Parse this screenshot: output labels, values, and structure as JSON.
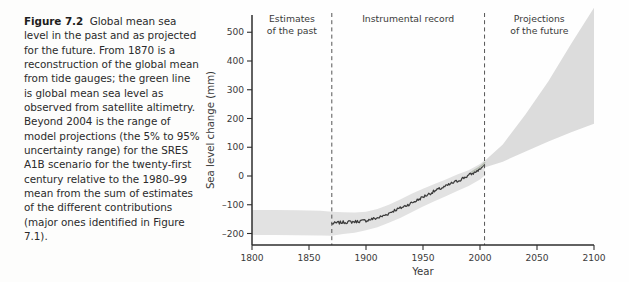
{
  "caption": {
    "figure_label": "Figure 7.2",
    "text": "Global mean sea level in the past and as projected for the future. From 1870 is a reconstruction of the global mean from tide gauges; the green line is global mean sea level as observed from satellite altimetry. Beyond 2004 is the range of model projections (the 5% to 95% uncertainty range) for the SRES A1B scenario for the twenty-first century relative to the 1980–99 mean from the sum of estimates of the different contributions (major ones identified in Figure 7.1)."
  },
  "colors": {
    "axis": "#2e2e2e",
    "band": "#e2e2e2",
    "reconstruction_line": "#3b3b3b",
    "satellite_line": "#b9bfb4",
    "projection_cone": "#dcdcdc",
    "divider": "#555555",
    "text": "#3a3a3a"
  },
  "chart_data": {
    "type": "line",
    "title": "",
    "xlabel": "Year",
    "ylabel": "Sea level change (mm)",
    "xlim": [
      1800,
      2100
    ],
    "ylim": [
      -240,
      560
    ],
    "xticks": [
      1800,
      1850,
      1900,
      1950,
      2000,
      2050,
      2100
    ],
    "xtick_labels": [
      "1800",
      "1850",
      "1900",
      "1950",
      "2000",
      "2050",
      "2100"
    ],
    "yticks": [
      -200,
      -100,
      0,
      100,
      200,
      300,
      400,
      500
    ],
    "ytick_labels": [
      "–200",
      "–100",
      "0",
      "100",
      "200",
      "300",
      "400",
      "500"
    ],
    "grid": false,
    "legend": "none",
    "region_dividers": [
      1870,
      2004
    ],
    "regions": [
      {
        "label": "Estimates\nof the past",
        "label_line1": "Estimates",
        "label_line2": "of the past",
        "x_center": 1835,
        "start": 1800,
        "end": 1870
      },
      {
        "label": "Instrumental record",
        "label_line1": "Instrumental record",
        "label_line2": "",
        "x_center": 1937,
        "start": 1870,
        "end": 2004
      },
      {
        "label": "Projections\nof the future",
        "label_line1": "Projections",
        "label_line2": "of the future",
        "x_center": 2052,
        "start": 2004,
        "end": 2100
      }
    ],
    "series": [
      {
        "name": "Estimates of the past (uncertainty band)",
        "type": "band",
        "x": [
          1800,
          1820,
          1840,
          1860,
          1870
        ],
        "upper": [
          -118,
          -118,
          -119,
          -121,
          -124
        ],
        "lower": [
          -205,
          -205,
          -206,
          -207,
          -208
        ]
      },
      {
        "name": "Tide gauge reconstruction uncertainty band",
        "type": "band",
        "x": [
          1870,
          1880,
          1890,
          1900,
          1910,
          1920,
          1930,
          1940,
          1950,
          1960,
          1970,
          1980,
          1990,
          2000,
          2004
        ],
        "upper": [
          -124,
          -126,
          -127,
          -124,
          -115,
          -100,
          -82,
          -62,
          -44,
          -28,
          -12,
          5,
          20,
          42,
          55
        ],
        "lower": [
          -208,
          -202,
          -197,
          -189,
          -178,
          -163,
          -146,
          -126,
          -106,
          -88,
          -70,
          -52,
          -35,
          -12,
          2
        ]
      },
      {
        "name": "Global mean sea level from tide gauges",
        "type": "line",
        "x": [
          1870,
          1875,
          1880,
          1885,
          1890,
          1895,
          1900,
          1905,
          1910,
          1915,
          1920,
          1925,
          1930,
          1935,
          1940,
          1945,
          1950,
          1955,
          1960,
          1965,
          1970,
          1975,
          1980,
          1985,
          1990,
          1995,
          2000,
          2004
        ],
        "y": [
          -166,
          -163,
          -161,
          -160,
          -159,
          -157,
          -155,
          -150,
          -146,
          -139,
          -130,
          -119,
          -112,
          -103,
          -94,
          -84,
          -73,
          -63,
          -53,
          -44,
          -36,
          -26,
          -18,
          -8,
          2,
          12,
          25,
          38
        ]
      },
      {
        "name": "Satellite altimetry (green line)",
        "type": "line",
        "x": [
          1993,
          1996,
          1999,
          2002,
          2004
        ],
        "y": [
          14,
          22,
          29,
          37,
          46
        ]
      },
      {
        "name": "Model projections SRES A1B (5% to 95% range)",
        "type": "band",
        "x": [
          2004,
          2020,
          2040,
          2060,
          2080,
          2100
        ],
        "upper": [
          52,
          110,
          215,
          330,
          460,
          585
        ],
        "lower": [
          30,
          50,
          85,
          120,
          152,
          182
        ]
      }
    ]
  }
}
